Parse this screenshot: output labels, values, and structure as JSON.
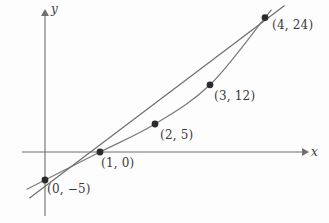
{
  "figure": {
    "background_color": "#fdfdfd",
    "axis_color": "#6f6f6f",
    "curve_color": "#7a7a7a",
    "line_color": "#6e6e6e",
    "point_color": "#2b2b2b",
    "text_color": "#3a3a3a"
  },
  "axes": {
    "x_axis_label": "x",
    "y_axis_label": "y",
    "x_axis_pixel_y": 152,
    "y_axis_pixel_x": 45,
    "x_unit_pixels": 55,
    "y_unit_pixels": 5.6
  },
  "chart_data": {
    "type": "scatter",
    "title": "",
    "xlabel": "x",
    "ylabel": "y",
    "grid": false,
    "legend": "none",
    "xlim": [
      -0.35,
      4.75
    ],
    "ylim": [
      -9,
      26
    ],
    "points": [
      {
        "x": 0,
        "y": -5,
        "label": "(0, −5)",
        "label_pos": "below-right"
      },
      {
        "x": 1,
        "y": 0,
        "label": "(1, 0)",
        "label_pos": "below-right"
      },
      {
        "x": 2,
        "y": 5,
        "label": "(2, 5)",
        "label_pos": "below-right"
      },
      {
        "x": 3,
        "y": 12,
        "label": "(3, 12)",
        "label_pos": "below-right"
      },
      {
        "x": 4,
        "y": 24,
        "label": "(4, 24)",
        "label_pos": "below-right"
      }
    ],
    "series": [
      {
        "name": "fitted-curve",
        "type": "curve",
        "through": [
          [
            0,
            -5
          ],
          [
            1,
            0
          ],
          [
            2,
            5
          ],
          [
            3,
            12
          ],
          [
            4,
            24
          ]
        ]
      },
      {
        "name": "secant-line",
        "type": "line",
        "through": [
          [
            -0.28,
            -8.2
          ],
          [
            4.35,
            26.1
          ]
        ]
      }
    ]
  },
  "point_labels": [
    {
      "text": "(0, −5)",
      "left": 47,
      "top": 182
    },
    {
      "text": "(1, 0)",
      "left": 101,
      "top": 156
    },
    {
      "text": "(2, 5)",
      "left": 160,
      "top": 128
    },
    {
      "text": "(3, 12)",
      "left": 214,
      "top": 89
    },
    {
      "text": "(4, 24)",
      "left": 272,
      "top": 18
    }
  ],
  "axis_labels": [
    {
      "text": "x",
      "left": 311,
      "top": 145
    },
    {
      "text": "y",
      "left": 51,
      "top": 2
    }
  ]
}
